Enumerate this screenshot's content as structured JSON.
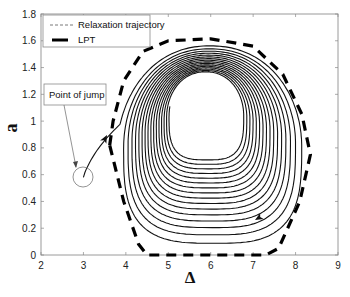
{
  "chart_data": {
    "type": "line",
    "title": "",
    "xlabel": "Δ",
    "ylabel": "a",
    "xlim": [
      2,
      9
    ],
    "ylim": [
      0,
      1.8
    ],
    "xticks": [
      "2",
      "3",
      "4",
      "5",
      "6",
      "7",
      "8",
      "9"
    ],
    "yticks": [
      "0",
      "0.2",
      "0.4",
      "0.6",
      "0.8",
      "1",
      "1.2",
      "1.4",
      "1.6",
      "1.8"
    ],
    "grid": false,
    "legend_position": "upper-left",
    "legend": [
      {
        "label": "Relaxation trajectory",
        "style": "thin-dashed"
      },
      {
        "label": "LPT",
        "style": "thick-dashed"
      }
    ],
    "annotations": [
      {
        "text": "Point of jump",
        "target": [
          3.0,
          0.58
        ]
      }
    ],
    "series": [
      {
        "name": "Relaxation trajectory",
        "description": "Spiral starting at point of jump (3.0, 0.58), rising to the outer loop near LPT and spiralling inward toward an inner cycle",
        "start": [
          3.0,
          0.58
        ],
        "outer_loop": {
          "center": [
            6.0,
            0.78
          ],
          "left": 3.8,
          "right": 8.25,
          "top": 1.57,
          "bottom": 0.02
        },
        "inner_loop": {
          "center": [
            5.88,
            1.04
          ],
          "left": 5.02,
          "right": 6.74,
          "top": 1.36,
          "bottom": 0.72
        },
        "loops": 16
      },
      {
        "name": "LPT",
        "points": [
          [
            3.62,
            0.82
          ],
          [
            3.7,
            1.0
          ],
          [
            3.95,
            1.3
          ],
          [
            4.4,
            1.52
          ],
          [
            5.0,
            1.6
          ],
          [
            6.0,
            1.615
          ],
          [
            7.0,
            1.56
          ],
          [
            7.7,
            1.35
          ],
          [
            8.15,
            1.05
          ],
          [
            8.35,
            0.75
          ],
          [
            8.1,
            0.4
          ],
          [
            7.6,
            0.05
          ],
          [
            7.3,
            0.0
          ],
          [
            4.5,
            0.0
          ],
          [
            4.3,
            0.08
          ],
          [
            3.95,
            0.4
          ],
          [
            3.62,
            0.82
          ]
        ]
      }
    ]
  }
}
